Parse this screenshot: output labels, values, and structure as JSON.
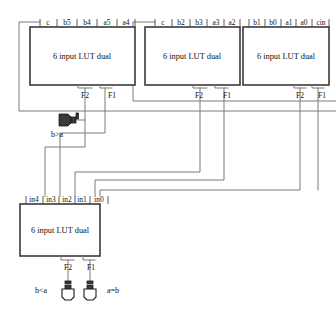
{
  "diagram": {
    "body_label": "6 input LUT dual",
    "out_f2": "F2",
    "out_f1": "F1"
  },
  "blocks": [
    {
      "id": "lut-a",
      "body": "6 input LUT dual",
      "inputs": [
        "c",
        "b5",
        "b4",
        "a5",
        "a4"
      ],
      "outputs": [
        "F2",
        "F1"
      ]
    },
    {
      "id": "lut-b",
      "body": "6 input LUT dual",
      "inputs": [
        "c",
        "b2",
        "b3",
        "a3",
        "a2"
      ],
      "outputs": [
        "F2",
        "F1"
      ]
    },
    {
      "id": "lut-c",
      "body": "6 input LUT dual",
      "inputs": [
        "b1",
        "b0",
        "a1",
        "a0",
        "cin"
      ],
      "outputs": [
        "F2",
        "F1"
      ]
    },
    {
      "id": "lut-d",
      "body": "6 input LUT dual",
      "inputs": [
        "in4",
        "in3",
        "in2",
        "in1",
        "in0"
      ],
      "outputs": [
        "F2",
        "F1"
      ]
    }
  ],
  "pads": [
    {
      "id": "pad-b-gt-a",
      "label": "b>a",
      "orientation": "horizontal"
    },
    {
      "id": "pad-b-lt-a",
      "label": "b<a",
      "orientation": "vertical"
    },
    {
      "id": "pad-a-eq-b",
      "label": "a=b",
      "orientation": "vertical"
    }
  ],
  "colors": {
    "box_stroke": "#3a3a3a",
    "wire": "#7a7a7a",
    "text": "#111111",
    "background": "#ffffff"
  }
}
